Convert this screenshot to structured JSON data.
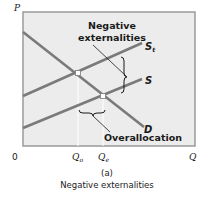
{
  "diagram": {
    "panel_label": "(a)",
    "caption": "Negative externalities",
    "axes": {
      "y_label": "P",
      "x_label": "Q",
      "origin_label": "0"
    },
    "curves": [
      {
        "id": "St",
        "label": "S",
        "subscript": "t",
        "type": "supply-total"
      },
      {
        "id": "S",
        "label": "S",
        "subscript": "",
        "type": "supply"
      },
      {
        "id": "D",
        "label": "D",
        "subscript": "",
        "type": "demand"
      }
    ],
    "quantities": [
      {
        "label": "Q",
        "subscript": "o"
      },
      {
        "label": "Q",
        "subscript": "e"
      }
    ],
    "annotations": {
      "negative_externalities_line1": "Negative",
      "negative_externalities_line2": "externalities",
      "overallocation": "Overallocation"
    },
    "colors": {
      "plot_background": "#ececec",
      "frame": "#9a9a9a",
      "curve": "#7a7a7a",
      "guide": "#ffffff",
      "text": "#1a1a1a"
    }
  }
}
